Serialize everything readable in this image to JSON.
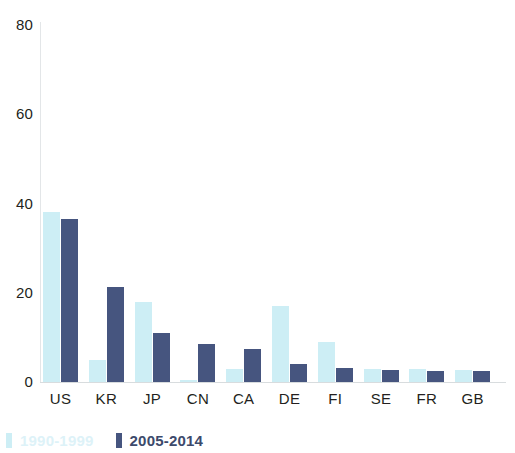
{
  "chart_data": {
    "type": "bar",
    "title": "",
    "subtitle": "",
    "xlabel": "",
    "ylabel": "",
    "ylim": [
      0,
      80
    ],
    "yticks": [
      0,
      20,
      40,
      60,
      80
    ],
    "grid": false,
    "legend_position": "bottom-left",
    "categories": [
      "US",
      "KR",
      "JP",
      "CN",
      "CA",
      "DE",
      "FI",
      "SE",
      "FR",
      "GB"
    ],
    "series": [
      {
        "name": "1990-1999",
        "color": "#cdeef5",
        "values": [
          38,
          5,
          18,
          0.5,
          3,
          17,
          9,
          3,
          3,
          2.8
        ]
      },
      {
        "name": "2005-2014",
        "color": "#46557f",
        "values": [
          36.5,
          21.2,
          11,
          8.5,
          7.5,
          4,
          3.2,
          2.7,
          2.5,
          2.5
        ]
      }
    ]
  },
  "axis": {
    "y_tick_labels": [
      "0",
      "20",
      "40",
      "60",
      "80"
    ]
  },
  "legend": {
    "items": [
      {
        "label": "1990-1999",
        "color": "#cdeef5"
      },
      {
        "label": "2005-2014",
        "color": "#46557f"
      }
    ]
  }
}
